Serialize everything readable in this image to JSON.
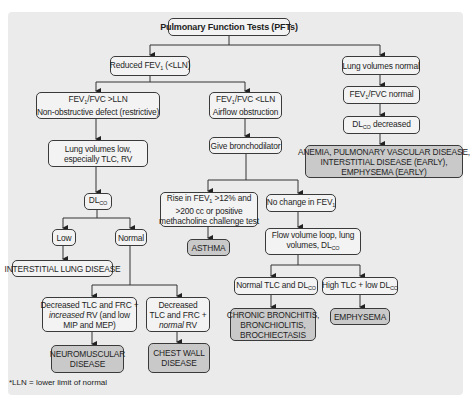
{
  "diagram": {
    "title": "Pulmonary Function Tests (PFTs)",
    "nodes": {
      "reduced_fev1": {
        "pre": "Reduced FEV",
        "sub": "1",
        "post": " (<LLN)"
      },
      "lung_volumes_normal": "Lung volumes normal",
      "restrictive": {
        "line1_pre": "FEV",
        "line1_sub": "1",
        "line1_post": "/FVC >LLN",
        "line2": "Non-obstructive defect (restrictive)"
      },
      "obstructive": {
        "line1_pre": "FEV",
        "line1_sub": "1",
        "line1_post": "/FVC <LLN",
        "line2": "Airflow obstruction"
      },
      "fev1_fvc_normal": {
        "pre": "FEV",
        "sub": "1",
        "post": "/FVC normal"
      },
      "dlco_decreased": {
        "pre": "DL",
        "sub": "CO",
        "post": " decreased"
      },
      "anemia": {
        "line1": "ANEMIA, PULMONARY VASCULAR DISEASE,",
        "line2": "INTERSTITIAL DISEASE (EARLY),",
        "line3": "EMPHYSEMA (EARLY)"
      },
      "lung_volumes_low": {
        "line1": "Lung volumes low,",
        "line2": "especially TLC, RV"
      },
      "give_bronchodilator": "Give bronchodilator",
      "dlco": {
        "pre": "DL",
        "sub": "CO"
      },
      "low": "Low",
      "normal": "Normal",
      "rise_fev1": {
        "line1_pre": "Rise in FEV",
        "line1_sub": "1",
        "line1_post": " >12% and",
        "line2": ">200 cc or positive",
        "line3": "methacholine challenge test"
      },
      "no_change_fev1": {
        "pre": "No change in FEV",
        "sub": "1"
      },
      "asthma": "ASTHMA",
      "flow_volume": {
        "line1": "Flow volume loop, lung",
        "line2_pre": "volumes, DL",
        "line2_sub": "CO"
      },
      "interstitial_lung_disease": "INTERSTITIAL LUNG DISEASE",
      "normal_tlc_dlco": {
        "pre": "Normal TLC and DL",
        "sub": "CO"
      },
      "high_tlc_low_dlco": {
        "pre": "High TLC + low DL",
        "sub": "CO"
      },
      "neuromuscular_criteria": {
        "line1": "Decreased TLC and FRC +",
        "line2_em": "increased",
        "line2_post": " RV (and low",
        "line3": "MIP and MEP)"
      },
      "chest_wall_criteria": {
        "line1": "Decreased",
        "line2": "TLC and FRC +",
        "line3_em": "normal",
        "line3_post": " RV"
      },
      "chronic_bronchitis": {
        "line1": "CHRONIC BRONCHITIS,",
        "line2": "BRONCHIOLITIS,",
        "line3": "BROCHIECTASIS"
      },
      "emphysema": "EMPHYSEMA",
      "neuromuscular_disease": {
        "line1": "NEUROMUSCULAR",
        "line2": "DISEASE"
      },
      "chest_wall_disease": {
        "line1": "CHEST WALL",
        "line2": "DISEASE"
      }
    },
    "footnote": "*LLN = lower limit of normal"
  }
}
